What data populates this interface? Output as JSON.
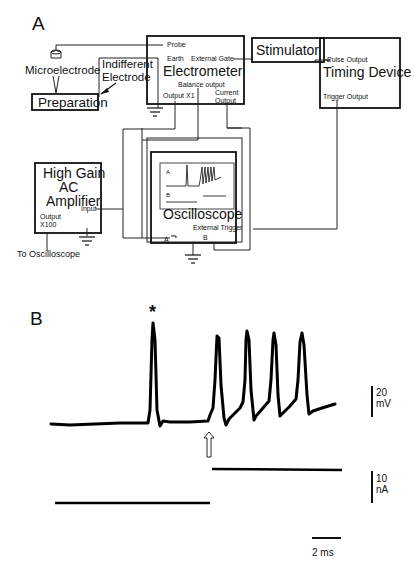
{
  "panel_a": {
    "label": "A",
    "microelectrode": {
      "label": "Microelectrode"
    },
    "indifferent_electrode": {
      "label_line1": "Indifferent",
      "label_line2": "Electrode"
    },
    "preparation": {
      "label": "Preparation"
    },
    "electrometer": {
      "title": "Electrometer",
      "probe": "Probe",
      "earth": "Earth",
      "external_gate": "External Gate",
      "balance_output": "Balance output",
      "output_x1": "Output X1",
      "current_output_line1": "Current",
      "current_output_line2": "Output"
    },
    "stimulator": {
      "title": "Stimulator"
    },
    "timing_device": {
      "title": "Timing Device",
      "pulse_output": "Pulse Output",
      "trigger_output": "Trigger Output"
    },
    "amplifier": {
      "title_line1": "High Gain",
      "title_line2": "AC",
      "title_line3": "Amplifier",
      "input": "Input",
      "output_line1": "Output",
      "output_line2": "X100",
      "to_oscilloscope": "To Oscilloscope"
    },
    "oscilloscope": {
      "title": "Oscilloscope",
      "screen_a": "A",
      "screen_b": "B",
      "input_a": "A",
      "input_b": "B",
      "external_trigger": "External Trigger"
    }
  },
  "panel_b": {
    "label": "B",
    "spontaneous_marker": "*",
    "stimulus_marker": "⇧",
    "scale_voltage_value": "20",
    "scale_voltage_unit": "mV",
    "scale_current_value": "10",
    "scale_current_unit": "nA",
    "scale_time": "2 ms"
  },
  "colors": {
    "ink": "#111111",
    "background": "#ffffff"
  }
}
